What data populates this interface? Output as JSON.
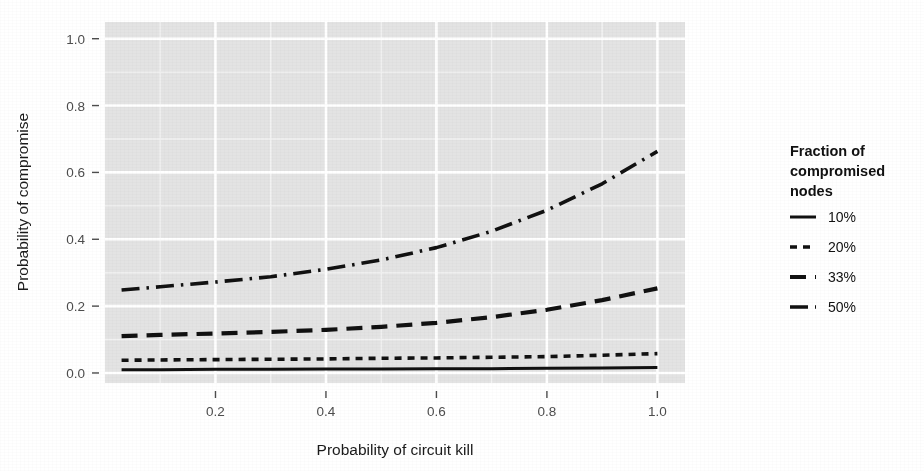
{
  "chart_data": {
    "type": "line",
    "title": "",
    "xlabel": "Probability of circuit kill",
    "ylabel": "Probability of compromise",
    "xlim": [
      0.0,
      1.05
    ],
    "ylim": [
      -0.03,
      1.05
    ],
    "xticks": [
      "0.2",
      "0.4",
      "0.6",
      "0.8",
      "1.0"
    ],
    "xtick_values": [
      0.2,
      0.4,
      0.6,
      0.8,
      1.0
    ],
    "yticks": [
      "0.0",
      "0.2",
      "0.4",
      "0.6",
      "0.8",
      "1.0"
    ],
    "ytick_values": [
      0.0,
      0.2,
      0.4,
      0.6,
      0.8,
      1.0
    ],
    "grid": true,
    "grid_color": "#ffffff",
    "panel_background": "#e3e3e3",
    "legend_position": "right",
    "legend_title": "Fraction of compromised nodes",
    "x": [
      0.03,
      0.1,
      0.2,
      0.3,
      0.4,
      0.5,
      0.6,
      0.7,
      0.8,
      0.9,
      1.0
    ],
    "series": [
      {
        "name": "10%",
        "dash": "solid",
        "color": "#111111",
        "values": [
          0.01,
          0.01,
          0.011,
          0.011,
          0.012,
          0.012,
          0.013,
          0.013,
          0.014,
          0.015,
          0.016
        ]
      },
      {
        "name": "20%",
        "dash": "dotted",
        "color": "#111111",
        "values": [
          0.038,
          0.039,
          0.04,
          0.041,
          0.042,
          0.044,
          0.045,
          0.047,
          0.049,
          0.053,
          0.058
        ]
      },
      {
        "name": "33%",
        "dash": "dashed",
        "color": "#111111",
        "values": [
          0.11,
          0.114,
          0.118,
          0.123,
          0.129,
          0.138,
          0.15,
          0.167,
          0.189,
          0.218,
          0.253
        ]
      },
      {
        "name": "50%",
        "dash": "dashdot",
        "color": "#111111",
        "values": [
          0.248,
          0.258,
          0.272,
          0.288,
          0.31,
          0.338,
          0.375,
          0.424,
          0.487,
          0.566,
          0.663
        ]
      }
    ]
  },
  "legend": {
    "title_lines": [
      "Fraction of",
      "compromised",
      "nodes"
    ],
    "entries": [
      {
        "label": "10%",
        "dash": "solid"
      },
      {
        "label": "20%",
        "dash": "dotted"
      },
      {
        "label": "33%",
        "dash": "dashed"
      },
      {
        "label": "50%",
        "dash": "dashdot"
      }
    ]
  }
}
